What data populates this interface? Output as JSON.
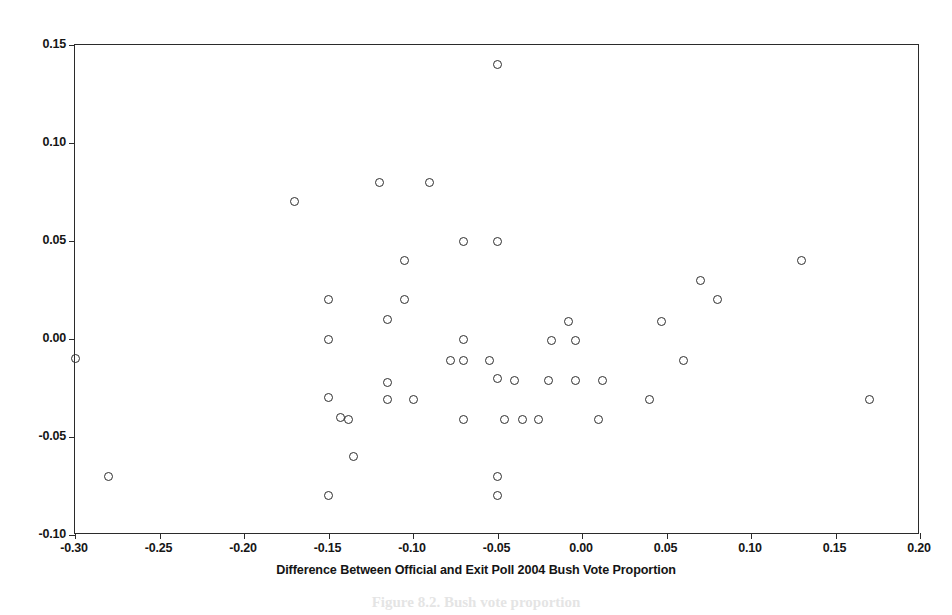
{
  "figure": {
    "background_color": "#ffffff",
    "frame_color": "#2b2b2b",
    "marker_color": "#2e2e2e",
    "caption_remnant": "Figure 8.2.  Bush vote proportion"
  },
  "chart_data": {
    "type": "scatter",
    "title": "",
    "xlabel": "Difference Between Official and Exit Poll 2004 Bush Vote Proportion",
    "ylabel": "",
    "xlim": [
      -0.3,
      0.2
    ],
    "ylim": [
      -0.1,
      0.15
    ],
    "xticks": [
      -0.3,
      -0.25,
      -0.2,
      -0.15,
      -0.1,
      -0.05,
      0.0,
      0.05,
      0.1,
      0.15,
      0.2
    ],
    "xticklabels": [
      "-0.30",
      "-0.25",
      "-0.20",
      "-0.15",
      "-0.10",
      "-0.05",
      "0.00",
      "0.05",
      "0.10",
      "0.15",
      "0.20"
    ],
    "yticks": [
      -0.1,
      -0.05,
      0.0,
      0.05,
      0.1,
      0.15
    ],
    "yticklabels": [
      "-0.10",
      "-0.05",
      "0.00",
      "0.05",
      "0.10",
      "0.15"
    ],
    "grid": false,
    "legend": null,
    "marker_style": "open-circle",
    "points": [
      {
        "x": -0.3,
        "y": -0.01
      },
      {
        "x": -0.28,
        "y": -0.07
      },
      {
        "x": -0.17,
        "y": 0.07
      },
      {
        "x": -0.15,
        "y": 0.02
      },
      {
        "x": -0.15,
        "y": 0.0
      },
      {
        "x": -0.15,
        "y": -0.03
      },
      {
        "x": -0.15,
        "y": -0.08
      },
      {
        "x": -0.143,
        "y": -0.04
      },
      {
        "x": -0.135,
        "y": -0.06
      },
      {
        "x": -0.138,
        "y": -0.041
      },
      {
        "x": -0.12,
        "y": 0.08
      },
      {
        "x": -0.115,
        "y": 0.01
      },
      {
        "x": -0.115,
        "y": -0.022
      },
      {
        "x": -0.115,
        "y": -0.031
      },
      {
        "x": -0.105,
        "y": 0.04
      },
      {
        "x": -0.105,
        "y": 0.02
      },
      {
        "x": -0.1,
        "y": -0.031
      },
      {
        "x": -0.09,
        "y": 0.08
      },
      {
        "x": -0.078,
        "y": -0.011
      },
      {
        "x": -0.07,
        "y": 0.05
      },
      {
        "x": -0.07,
        "y": 0.0
      },
      {
        "x": -0.07,
        "y": -0.011
      },
      {
        "x": -0.07,
        "y": -0.041
      },
      {
        "x": -0.055,
        "y": -0.011
      },
      {
        "x": -0.05,
        "y": 0.14
      },
      {
        "x": -0.05,
        "y": 0.05
      },
      {
        "x": -0.05,
        "y": -0.02
      },
      {
        "x": -0.05,
        "y": -0.07
      },
      {
        "x": -0.05,
        "y": -0.08
      },
      {
        "x": -0.046,
        "y": -0.041
      },
      {
        "x": -0.04,
        "y": -0.021
      },
      {
        "x": -0.035,
        "y": -0.041
      },
      {
        "x": -0.026,
        "y": -0.041
      },
      {
        "x": -0.02,
        "y": -0.021
      },
      {
        "x": -0.018,
        "y": -0.001
      },
      {
        "x": -0.008,
        "y": 0.009
      },
      {
        "x": -0.004,
        "y": -0.001
      },
      {
        "x": -0.004,
        "y": -0.021
      },
      {
        "x": 0.01,
        "y": -0.041
      },
      {
        "x": 0.012,
        "y": -0.021
      },
      {
        "x": 0.04,
        "y": -0.031
      },
      {
        "x": 0.047,
        "y": 0.009
      },
      {
        "x": 0.06,
        "y": -0.011
      },
      {
        "x": 0.07,
        "y": 0.03
      },
      {
        "x": 0.08,
        "y": 0.02
      },
      {
        "x": 0.13,
        "y": 0.04
      },
      {
        "x": 0.17,
        "y": -0.031
      }
    ]
  }
}
